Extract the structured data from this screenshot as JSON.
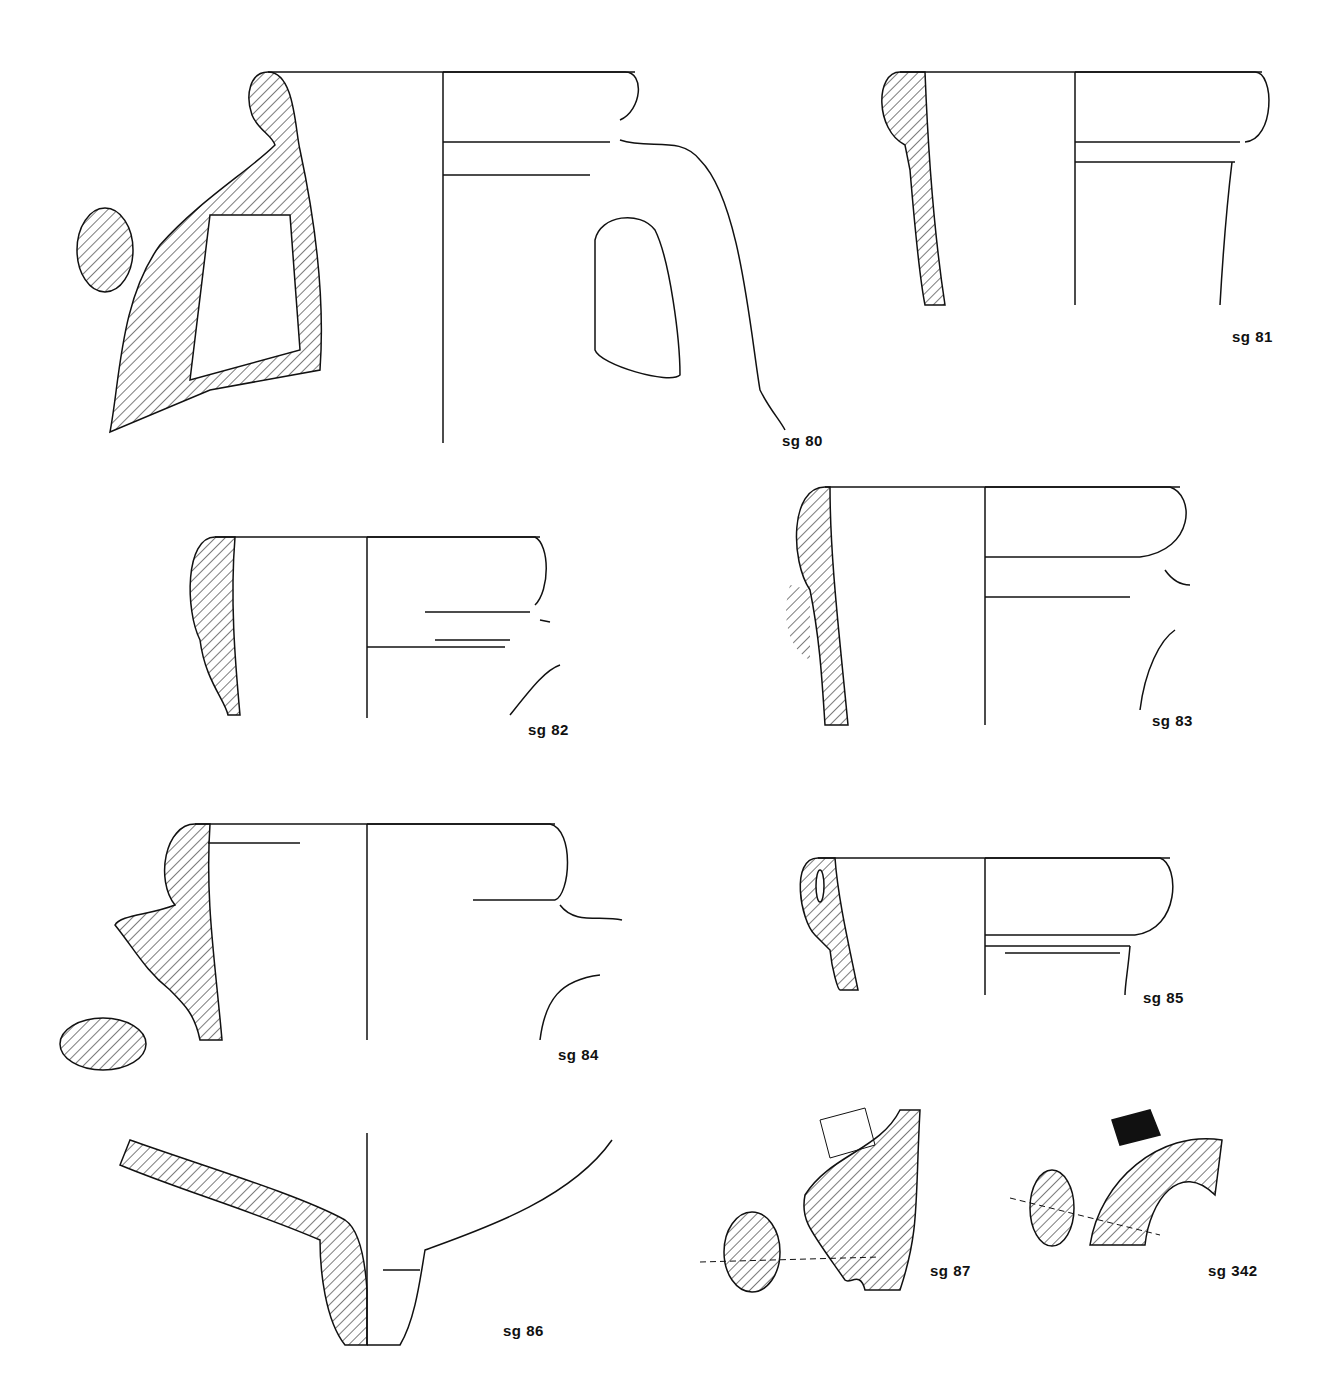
{
  "plate": {
    "title": "Pottery profile drawings",
    "figures": [
      {
        "id": "sg80",
        "label": "sg 80",
        "type": "jug rim with handle, handle section"
      },
      {
        "id": "sg81",
        "label": "sg 81",
        "type": "rim profile"
      },
      {
        "id": "sg82",
        "label": "sg 82",
        "type": "rim profile with handle stub"
      },
      {
        "id": "sg83",
        "label": "sg 83",
        "type": "rim profile with handle stub"
      },
      {
        "id": "sg84",
        "label": "sg 84",
        "type": "rim profile with handle, handle section"
      },
      {
        "id": "sg85",
        "label": "sg 85",
        "type": "rim profile"
      },
      {
        "id": "sg86",
        "label": "sg 86",
        "type": "base / foot profile"
      },
      {
        "id": "sg87",
        "label": "sg 87",
        "type": "handle fragment with stamp"
      },
      {
        "id": "sg342",
        "label": "sg 342",
        "type": "handle fragment with stamp"
      }
    ]
  },
  "colors": {
    "ink": "#111111",
    "paper": "#ffffff"
  }
}
